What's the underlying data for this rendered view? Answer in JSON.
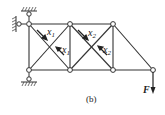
{
  "figure": {
    "caption": "(b)",
    "force_label": "F",
    "member_labels": [
      {
        "text": "x",
        "sub": "1"
      },
      {
        "text": "x",
        "sub": "1"
      },
      {
        "text": "x",
        "sub": "2"
      },
      {
        "text": "x",
        "sub": "2"
      }
    ]
  }
}
